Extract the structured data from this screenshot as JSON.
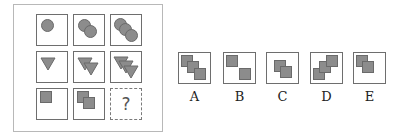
{
  "puzzle": {
    "question_mark": "?",
    "shape_fill": "#8c8c8c",
    "shape_stroke": "#6a6a6a",
    "grid": [
      [
        {
          "shape": "circle",
          "count": 1
        },
        {
          "shape": "circle",
          "count": 2
        },
        {
          "shape": "circle",
          "count": 3
        }
      ],
      [
        {
          "shape": "triangle-down",
          "count": 1
        },
        {
          "shape": "triangle-down",
          "count": 2
        },
        {
          "shape": "triangle-down",
          "count": 3
        }
      ],
      [
        {
          "shape": "square",
          "count": 1
        },
        {
          "shape": "square",
          "count": 2
        },
        {
          "shape": "unknown",
          "count": null
        }
      ]
    ]
  },
  "options": [
    {
      "label": "A",
      "shape": "square",
      "count": 3,
      "arrangement": "diagonal top-left to bottom-right"
    },
    {
      "label": "B",
      "shape": "square",
      "count": 2,
      "arrangement": "separated top-left and bottom-right"
    },
    {
      "label": "C",
      "shape": "square",
      "count": 2,
      "arrangement": "overlapping centered"
    },
    {
      "label": "D",
      "shape": "square",
      "count": 3,
      "arrangement": "diagonal bottom-left to top-right"
    },
    {
      "label": "E",
      "shape": "square",
      "count": 2,
      "arrangement": "overlapping top-left"
    }
  ]
}
